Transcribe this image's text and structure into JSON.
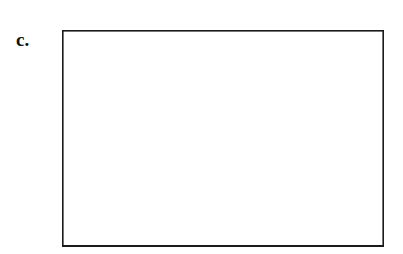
{
  "figure": {
    "panel_label": "c.",
    "background_color": "#ffffff"
  },
  "chart_data": {
    "type": "bar",
    "title": "",
    "subtitle": "",
    "xlabel": "",
    "ylabel": "",
    "categories": [
      "1",
      "2",
      "3",
      "4",
      "5",
      "6",
      "7",
      "8",
      "9"
    ],
    "values": [
      0.45,
      1.05,
      1.05,
      2.3,
      3.25,
      3.95,
      5.05,
      4.5,
      2.65
    ],
    "series": [
      {
        "name": "frequency",
        "values": [
          0.45,
          1.05,
          1.05,
          2.3,
          3.25,
          3.95,
          5.05,
          4.5,
          2.65
        ]
      }
    ],
    "ylim": [
      0,
      8
    ],
    "xlim": [
      0,
      9
    ],
    "yticks": [
      0,
      1,
      2,
      3,
      4,
      5,
      6,
      7,
      8
    ],
    "ytick_labels": [],
    "xtick_labels": [],
    "grid": true,
    "grid_axis": "y",
    "legend": false,
    "legend_position": "none",
    "annotations": [],
    "bar_fill_color": "#e4e4e4",
    "bar_edge_color": "#3a3a3a",
    "grid_color": "#c2c2c2",
    "frame_color": "#1a1a1a",
    "bar_gap": 0
  }
}
